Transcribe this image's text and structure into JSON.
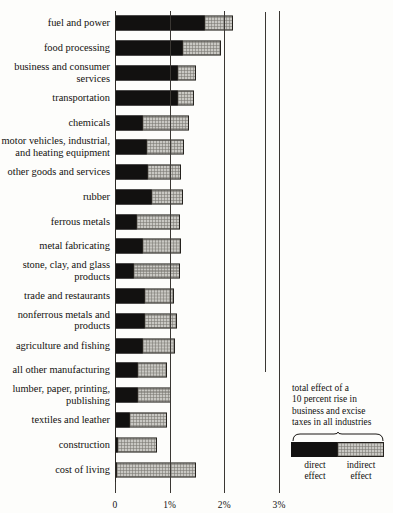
{
  "chart_data": {
    "type": "bar",
    "orientation": "horizontal",
    "stacked": true,
    "title": "",
    "xlabel": "",
    "ylabel": "",
    "xlim": [
      0,
      3.2
    ],
    "grid": false,
    "tick_values": [
      0,
      1,
      2,
      3
    ],
    "tick_labels": [
      "0",
      "1%",
      "2%",
      "3%"
    ],
    "series": [
      {
        "name": "direct effect",
        "color": "#121110"
      },
      {
        "name": "indirect effect",
        "color": "#c9c8c3"
      }
    ],
    "categories": [
      "fuel and power",
      "food processing",
      "business and consumer\nservices",
      "transportation",
      "chemicals",
      "motor vehicles, industrial,\nand heating equipment",
      "other goods and services",
      "rubber",
      "ferrous metals",
      "metal fabricating",
      "stone, clay, and glass\nproducts",
      "trade and restaurants",
      "nonferrous metals and\nproducts",
      "agriculture and fishing",
      "all other manufacturing",
      "lumber, paper, printing,\npublishing",
      "textiles and leather",
      "construction",
      "cost of living"
    ],
    "rows": [
      {
        "label": "fuel and power",
        "direct": 1.65,
        "indirect": 0.53,
        "total": 2.18
      },
      {
        "label": "food processing",
        "direct": 1.25,
        "indirect": 0.71,
        "total": 1.96
      },
      {
        "label": "business and consumer\nservices",
        "direct": 1.16,
        "indirect": 0.34,
        "total": 1.5
      },
      {
        "label": "transportation",
        "direct": 1.16,
        "indirect": 0.31,
        "total": 1.47
      },
      {
        "label": "chemicals",
        "direct": 0.52,
        "indirect": 0.85,
        "total": 1.37
      },
      {
        "label": "motor vehicles, industrial,\nand heating equipment",
        "direct": 0.59,
        "indirect": 0.69,
        "total": 1.28
      },
      {
        "label": "other goods and services",
        "direct": 0.61,
        "indirect": 0.62,
        "total": 1.23
      },
      {
        "label": "rubber",
        "direct": 0.68,
        "indirect": 0.58,
        "total": 1.26
      },
      {
        "label": "ferrous metals",
        "direct": 0.41,
        "indirect": 0.79,
        "total": 1.2
      },
      {
        "label": "metal fabricating",
        "direct": 0.51,
        "indirect": 0.72,
        "total": 1.23
      },
      {
        "label": "stone, clay, and glass\nproducts",
        "direct": 0.35,
        "indirect": 0.85,
        "total": 1.2
      },
      {
        "label": "trade and restaurants",
        "direct": 0.55,
        "indirect": 0.55,
        "total": 1.1
      },
      {
        "label": "nonferrous metals and\nproducts",
        "direct": 0.55,
        "indirect": 0.6,
        "total": 1.15
      },
      {
        "label": "agriculture and fishing",
        "direct": 0.51,
        "indirect": 0.61,
        "total": 1.12
      },
      {
        "label": "all other manufacturing",
        "direct": 0.42,
        "indirect": 0.55,
        "total": 0.97
      },
      {
        "label": "lumber, paper, printing,\npublishing",
        "direct": 0.42,
        "indirect": 0.62,
        "total": 1.04
      },
      {
        "label": "textiles and leather",
        "direct": 0.28,
        "indirect": 0.69,
        "total": 0.97
      },
      {
        "label": "construction",
        "direct": 0.06,
        "indirect": 0.73,
        "total": 0.79
      },
      {
        "label": "cost of living",
        "direct": 0.04,
        "indirect": 1.46,
        "total": 1.5
      }
    ]
  },
  "legend": {
    "caption": "total effect of a\n10 percent rise in\nbusiness and excise\ntaxes in all industries",
    "direct_label": "direct\neffect",
    "indirect_label": "indirect\neffect"
  }
}
